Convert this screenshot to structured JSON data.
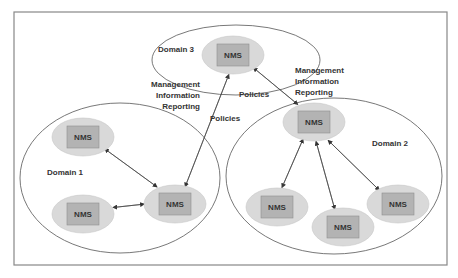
{
  "diagram": {
    "colors": {
      "node_fill": "#d9d9d9",
      "node_box": "#b3b3b3",
      "line": "#444444",
      "frame": "#888888"
    },
    "domains": [
      {
        "id": "d1",
        "label": "Domain 1"
      },
      {
        "id": "d2",
        "label": "Domain 2"
      },
      {
        "id": "d3",
        "label": "Domain 3"
      }
    ],
    "nodes": [
      {
        "id": "n3",
        "domain": "d3",
        "label": "NMS",
        "role": "hub"
      },
      {
        "id": "n1",
        "domain": "d1",
        "label": "NMS",
        "role": "hub"
      },
      {
        "id": "n1a",
        "domain": "d1",
        "label": "NMS",
        "role": "leaf"
      },
      {
        "id": "n1b",
        "domain": "d1",
        "label": "NMS",
        "role": "leaf"
      },
      {
        "id": "n2",
        "domain": "d2",
        "label": "NMS",
        "role": "hub"
      },
      {
        "id": "n2a",
        "domain": "d2",
        "label": "NMS",
        "role": "leaf"
      },
      {
        "id": "n2b",
        "domain": "d2",
        "label": "NMS",
        "role": "leaf"
      },
      {
        "id": "n2c",
        "domain": "d2",
        "label": "NMS",
        "role": "leaf"
      }
    ],
    "edges": [
      {
        "from": "n1",
        "to": "n3",
        "label": "Management Information Reporting"
      },
      {
        "from": "n3",
        "to": "n1",
        "label": "Policies"
      },
      {
        "from": "n3",
        "to": "n2",
        "label": "Policies"
      },
      {
        "from": "n2",
        "to": "n3",
        "label": "Management Information Reporting"
      },
      {
        "from": "n1",
        "to": "n1a"
      },
      {
        "from": "n1a",
        "to": "n1"
      },
      {
        "from": "n1",
        "to": "n1b"
      },
      {
        "from": "n1b",
        "to": "n1"
      },
      {
        "from": "n2",
        "to": "n2a"
      },
      {
        "from": "n2a",
        "to": "n2"
      },
      {
        "from": "n2",
        "to": "n2b"
      },
      {
        "from": "n2b",
        "to": "n2"
      },
      {
        "from": "n2",
        "to": "n2c"
      },
      {
        "from": "n2c",
        "to": "n2"
      }
    ],
    "labels": {
      "mir_left": [
        "Management",
        "Information",
        "Reporting"
      ],
      "policies_left": "Policies",
      "policies_right": "Policies",
      "mir_right": [
        "Management",
        "Information",
        "Reporting"
      ]
    }
  }
}
